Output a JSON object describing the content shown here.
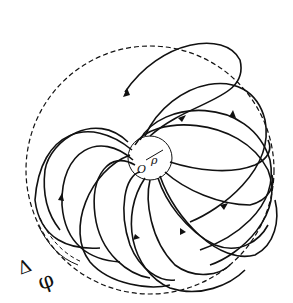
{
  "diagram": {
    "title": "",
    "labels": {
      "origin": "O",
      "radius": "ρ",
      "delta": "Δ",
      "phi": "φ"
    },
    "elements": {
      "outer_boundary": "dashed circle",
      "inner_boundary": "small circle around origin",
      "trajectories": "family of spiral curves with direction arrows emanating from inner circle"
    },
    "colors": {
      "ink": "#111111",
      "background": "#ffffff"
    }
  }
}
